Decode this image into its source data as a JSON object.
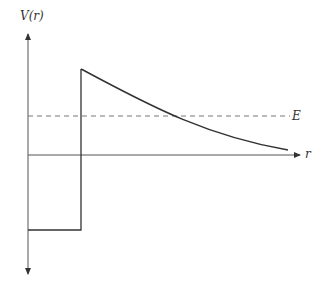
{
  "diagram": {
    "y_axis_label": "V(r)",
    "x_axis_label": "r",
    "energy_label": "E",
    "colors": {
      "axis": "#555555",
      "curve": "#333333",
      "dashed": "#777777"
    },
    "elements": [
      {
        "name": "square-well",
        "description": "Constant negative potential inside wall"
      },
      {
        "name": "potential-wall",
        "description": "Vertical jump at nuclear radius"
      },
      {
        "name": "coulomb-barrier",
        "description": "Decaying curve ~1/r toward zero"
      },
      {
        "name": "energy-level",
        "description": "Dashed horizontal line at energy E"
      }
    ]
  }
}
